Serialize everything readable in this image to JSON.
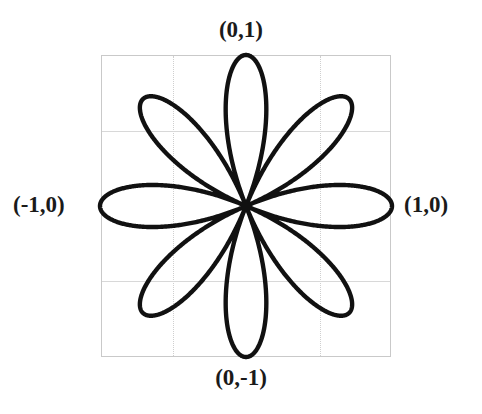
{
  "figure": {
    "title": "",
    "background": "#ffffff"
  },
  "labels": {
    "top": "(0,1)",
    "bottom": "(0,-1)",
    "left": "(-1,0)",
    "right": "(1,0)"
  },
  "style": {
    "curve_color": "#111111",
    "curve_width": 4.4,
    "frame_color": "#c9c9c9",
    "grid_color": "#d2d2d2",
    "label_color": "#1a1a1a"
  },
  "chart_data": {
    "type": "line",
    "subtype": "polar-rose",
    "title": "",
    "xlabel": "",
    "ylabel": "",
    "equation": "r = cos(4θ)",
    "petal_count": 8,
    "petal_angles_deg": [
      0,
      45,
      90,
      135,
      180,
      225,
      270,
      315
    ],
    "max_radius": 1,
    "xlim": [
      -1.1,
      1.1
    ],
    "ylim": [
      -1.1,
      1.1
    ],
    "grid": true,
    "grid_x": [
      -0.5,
      0.5
    ],
    "grid_y": [
      -0.5,
      0.5
    ],
    "legend": "none",
    "annotations": [
      {
        "text": "(0,1)",
        "x": 0,
        "y": 1
      },
      {
        "text": "(1,0)",
        "x": 1,
        "y": 0
      },
      {
        "text": "(0,-1)",
        "x": 0,
        "y": -1
      },
      {
        "text": "(-1,0)",
        "x": -1,
        "y": 0
      }
    ],
    "geometry": {
      "center_x_px": 246,
      "center_y_px": 206,
      "radius_x_px": 146,
      "radius_y_px": 151
    }
  }
}
